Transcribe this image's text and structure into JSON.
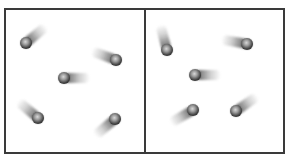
{
  "diagram": {
    "colors": {
      "border": "#3a3a3a",
      "background": "#ffffff",
      "particle": "#3c3c3c"
    },
    "panels": [
      {
        "name": "left-box",
        "x": 4,
        "y": 8,
        "width": 142,
        "height": 146,
        "particles": [
          {
            "x": 26,
            "y": 43,
            "trail_angle": -40
          },
          {
            "x": 116,
            "y": 60,
            "trail_angle": 200
          },
          {
            "x": 64,
            "y": 78,
            "trail_angle": 0
          },
          {
            "x": 38,
            "y": 118,
            "trail_angle": 220
          },
          {
            "x": 115,
            "y": 119,
            "trail_angle": 140
          }
        ]
      },
      {
        "name": "right-box",
        "x": 144,
        "y": 8,
        "width": 141,
        "height": 146,
        "particles": [
          {
            "x": 167,
            "y": 50,
            "trail_angle": -105
          },
          {
            "x": 247,
            "y": 44,
            "trail_angle": 190
          },
          {
            "x": 195,
            "y": 75,
            "trail_angle": 0
          },
          {
            "x": 193,
            "y": 110,
            "trail_angle": 150
          },
          {
            "x": 236,
            "y": 111,
            "trail_angle": -35
          }
        ]
      }
    ]
  }
}
